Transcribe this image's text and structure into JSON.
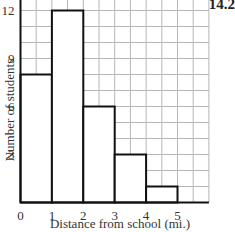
{
  "corner_label": "14.2",
  "chart_data": {
    "type": "bar",
    "subtype": "histogram",
    "title": "",
    "xlabel": "Distance from school (mi.)",
    "ylabel": "Number of students",
    "bins": [
      [
        0,
        1
      ],
      [
        1,
        2
      ],
      [
        2,
        3
      ],
      [
        3,
        4
      ],
      [
        4,
        5
      ]
    ],
    "categories": [
      "0-1",
      "1-2",
      "2-3",
      "3-4",
      "4-5"
    ],
    "values": [
      8,
      12,
      6,
      3,
      1
    ],
    "x_ticks": [
      "0",
      "1",
      "2",
      "3",
      "4",
      "5"
    ],
    "y_ticks": [
      "3",
      "6",
      "9",
      "12"
    ],
    "xlim": [
      0,
      6
    ],
    "ylim": [
      0,
      12.7
    ],
    "grid": true,
    "grid_x_step": 0.5,
    "grid_y_step": 1,
    "bar_fill": "#ffffff",
    "bar_edge": "#111111",
    "grid_color": "#b5b5b5"
  }
}
